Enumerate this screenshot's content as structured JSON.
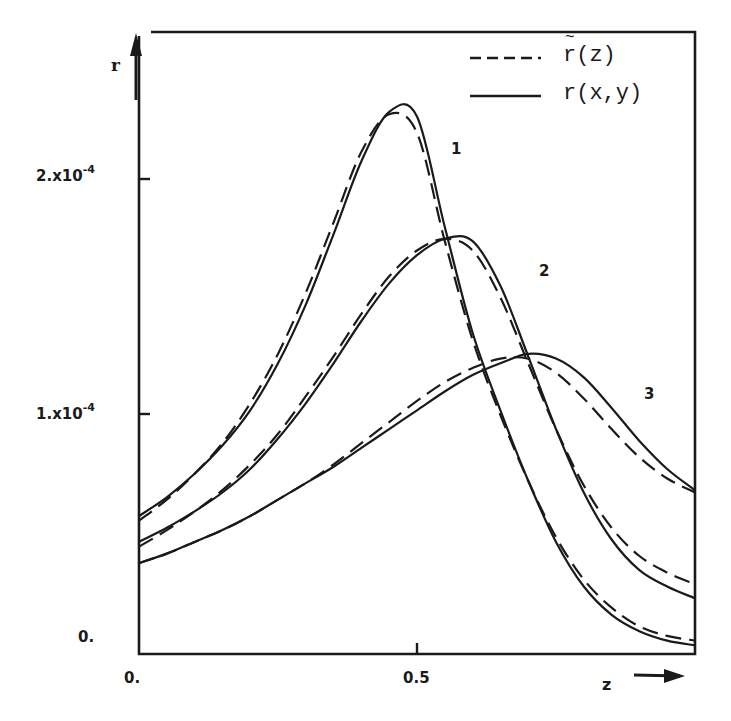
{
  "chart_data": {
    "type": "line",
    "title": "",
    "xlabel": "z",
    "ylabel": "r",
    "xlim": [
      0,
      1
    ],
    "ylim": [
      0,
      0.00026
    ],
    "grid": false,
    "legend_position": "top-right",
    "x_ticks": [
      {
        "value": 0,
        "label": "0."
      },
      {
        "value": 0.5,
        "label": "0.5"
      }
    ],
    "y_ticks": [
      {
        "value": 0,
        "label": "0."
      },
      {
        "value": 0.0001,
        "label": "1.x10",
        "exp": "-4"
      },
      {
        "value": 0.0002,
        "label": "2.x10",
        "exp": "-4"
      }
    ],
    "legend": [
      {
        "name": "r~(z)",
        "display": "r(z)",
        "style": "dashed"
      },
      {
        "name": "r(x,y)",
        "display": "r(x,y)",
        "style": "solid"
      }
    ],
    "curve_labels": [
      "1",
      "2",
      "3"
    ],
    "units_note": "values in units of 1e-4",
    "x": [
      0.0,
      0.05,
      0.1,
      0.15,
      0.2,
      0.25,
      0.3,
      0.35,
      0.4,
      0.45,
      0.5,
      0.55,
      0.6,
      0.65,
      0.7,
      0.75,
      0.8,
      0.85,
      0.9,
      0.95,
      1.0
    ],
    "series": [
      {
        "name": "curve 1 r(x,y)",
        "curve": "1",
        "style": "solid",
        "values": [
          0.57,
          0.65,
          0.75,
          0.87,
          1.02,
          1.22,
          1.47,
          1.77,
          2.08,
          2.29,
          2.27,
          1.8,
          1.35,
          1.02,
          0.72,
          0.46,
          0.27,
          0.15,
          0.08,
          0.04,
          0.02
        ]
      },
      {
        "name": "curve 1 r~(z)",
        "curve": "1",
        "style": "dashed",
        "values": [
          0.55,
          0.64,
          0.75,
          0.88,
          1.05,
          1.26,
          1.52,
          1.82,
          2.12,
          2.28,
          2.2,
          1.74,
          1.32,
          1.0,
          0.72,
          0.48,
          0.3,
          0.18,
          0.1,
          0.06,
          0.04
        ]
      },
      {
        "name": "curve 2 r(x,y)",
        "curve": "2",
        "style": "solid",
        "values": [
          0.46,
          0.52,
          0.59,
          0.67,
          0.77,
          0.9,
          1.05,
          1.22,
          1.4,
          1.56,
          1.68,
          1.75,
          1.74,
          1.55,
          1.25,
          0.94,
          0.67,
          0.47,
          0.34,
          0.27,
          0.22
        ]
      },
      {
        "name": "curve 2 r~(z)",
        "curve": "2",
        "style": "dashed",
        "values": [
          0.44,
          0.51,
          0.59,
          0.68,
          0.79,
          0.92,
          1.08,
          1.25,
          1.43,
          1.59,
          1.7,
          1.75,
          1.7,
          1.5,
          1.22,
          0.94,
          0.7,
          0.52,
          0.4,
          0.33,
          0.28
        ]
      },
      {
        "name": "curve 3 r(x,y)",
        "curve": "3",
        "style": "solid",
        "values": [
          0.37,
          0.41,
          0.46,
          0.51,
          0.57,
          0.64,
          0.71,
          0.78,
          0.86,
          0.94,
          1.02,
          1.1,
          1.17,
          1.22,
          1.26,
          1.24,
          1.16,
          1.03,
          0.89,
          0.77,
          0.68
        ]
      },
      {
        "name": "curve 3 r~(z)",
        "curve": "3",
        "style": "dashed",
        "values": [
          0.37,
          0.41,
          0.46,
          0.51,
          0.57,
          0.64,
          0.71,
          0.79,
          0.88,
          0.97,
          1.06,
          1.14,
          1.2,
          1.24,
          1.24,
          1.18,
          1.07,
          0.94,
          0.82,
          0.73,
          0.67
        ]
      }
    ],
    "peaks": [
      {
        "curve": "1",
        "z": 0.48,
        "r": 0.000231
      },
      {
        "curve": "2",
        "z": 0.59,
        "r": 0.000175
      },
      {
        "curve": "3",
        "z": 0.71,
        "r": 0.000126
      }
    ]
  },
  "axes": {
    "y_axis_label": "r",
    "x_axis_label": "z",
    "y_tick_labels": [
      {
        "base": "2.x10",
        "exp": "-4"
      },
      {
        "base": "1.x10",
        "exp": "-4"
      },
      {
        "base": "0.",
        "exp": ""
      }
    ],
    "x_tick_labels": [
      "0.",
      "0.5"
    ]
  },
  "legend": {
    "dashed_label": "r(z)",
    "solid_label": "r(x,y)"
  },
  "curve_labels": [
    "1",
    "2",
    "3"
  ]
}
